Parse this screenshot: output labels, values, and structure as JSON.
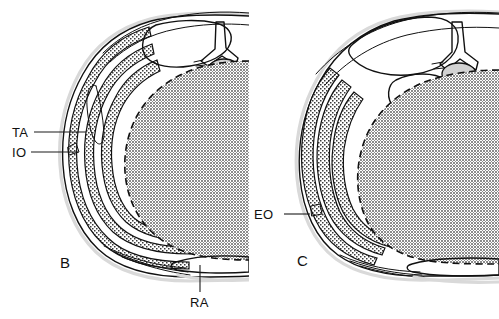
{
  "figure": {
    "kind": "anatomical-cross-section",
    "background_color": "#ffffff",
    "ink_color": "#111111",
    "cavity_fill_color": "#9a9a9a",
    "muscle_fill_color": "#e8e8e8",
    "bone_marrow_color": "#1a1a1a"
  },
  "panels": [
    {
      "id": "B",
      "letter": "B",
      "letter_x": 60,
      "letter_y": 268,
      "labels": [
        {
          "id": "TA",
          "text": "TA",
          "text_x": 12,
          "text_y": 137,
          "leader": {
            "x1": 34,
            "y1": 132,
            "x2": 86,
            "y2": 132
          },
          "meaning": "transversus abdominis"
        },
        {
          "id": "IO",
          "text": "IO",
          "text_x": 12,
          "text_y": 157,
          "leader": {
            "x1": 31,
            "y1": 152,
            "x2": 78,
            "y2": 152
          },
          "meaning": "internal oblique"
        },
        {
          "id": "RA",
          "text": "RA",
          "text_x": 190,
          "text_y": 307,
          "leader": {
            "x1": 200,
            "y1": 265,
            "x2": 200,
            "y2": 292
          },
          "meaning": "rectus abdominis"
        }
      ]
    },
    {
      "id": "C",
      "letter": "C",
      "letter_x": 297,
      "letter_y": 266,
      "labels": [
        {
          "id": "EO",
          "text": "EO",
          "text_x": 254,
          "text_y": 219,
          "leader": {
            "x1": 284,
            "y1": 214,
            "x2": 310,
            "y2": 214
          },
          "meaning": "external oblique"
        }
      ]
    }
  ]
}
